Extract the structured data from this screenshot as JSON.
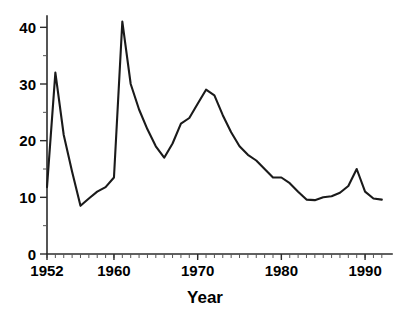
{
  "chart_data": {
    "type": "line",
    "title": "",
    "subtitle": "",
    "xlabel": "Year",
    "ylabel": "",
    "xlim": [
      1952,
      1992.5
    ],
    "ylim": [
      0,
      42
    ],
    "grid": false,
    "legend": null,
    "legend_position": "none",
    "x_ticks_major": [
      1952,
      1960,
      1970,
      1980,
      1990
    ],
    "x_tick_labels": [
      "1952",
      "1960",
      "1970",
      "1980",
      "1990"
    ],
    "x_minor_tick_step": 1,
    "y_ticks_major": [
      0,
      10,
      20,
      30,
      40
    ],
    "y_tick_labels": [
      "0",
      "10",
      "20",
      "30",
      "40"
    ],
    "y_minor_tick_step": 5,
    "series": [
      {
        "name": "series-1",
        "color": "#1a1a1a",
        "x": [
          1952,
          1953,
          1954,
          1955,
          1956,
          1957,
          1958,
          1959,
          1960,
          1961,
          1962,
          1963,
          1964,
          1965,
          1966,
          1967,
          1968,
          1969,
          1970,
          1971,
          1972,
          1973,
          1974,
          1975,
          1976,
          1977,
          1978,
          1979,
          1980,
          1981,
          1982,
          1983,
          1984,
          1985,
          1986,
          1987,
          1988,
          1989,
          1990,
          1991,
          1992
        ],
        "values": [
          11.8,
          32.0,
          21.0,
          14.5,
          8.5,
          9.8,
          11.0,
          11.8,
          13.5,
          41.0,
          30.0,
          25.5,
          22.0,
          19.0,
          17.0,
          19.5,
          23.0,
          24.0,
          26.5,
          29.0,
          28.0,
          24.5,
          21.5,
          19.0,
          17.5,
          16.5,
          15.0,
          13.5,
          13.5,
          12.5,
          11.0,
          9.6,
          9.5,
          10.0,
          10.2,
          10.8,
          12.0,
          15.0,
          11.0,
          9.8,
          9.6
        ]
      }
    ],
    "annotations": []
  },
  "axis": {
    "x_title": "Year"
  }
}
